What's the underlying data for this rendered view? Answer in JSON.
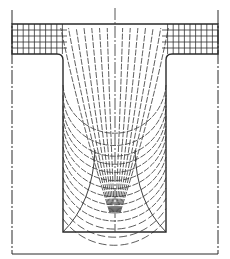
{
  "colors": {
    "background": "#ffffff",
    "line": "#2a2a2a",
    "mesh": "#333333",
    "centerline": "#444444"
  },
  "diagram": {
    "elements": [
      {
        "id": "outer-boundary",
        "kind": "frame",
        "style": "thin solid with dash-dot verticals"
      },
      {
        "id": "flange",
        "kind": "rectangular slab",
        "mesh": "square grid"
      },
      {
        "id": "stem",
        "kind": "rectangular web",
        "mesh": "curvilinear (arcs and radial lines)"
      },
      {
        "id": "centerline",
        "kind": "dash-dot axis of symmetry"
      },
      {
        "id": "corner-fillets",
        "kind": "rounded re-entrant corners"
      },
      {
        "id": "base-diagonals",
        "kind": "diagonal lines to base corners"
      }
    ],
    "flange_grid": {
      "columns_per_side": 8,
      "rows": 5
    },
    "stem_arcs": 14,
    "stem_radials_per_side": 7
  }
}
